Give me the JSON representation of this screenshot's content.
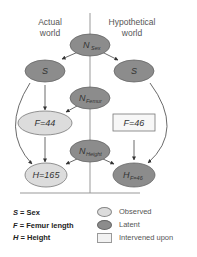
{
  "headers": {
    "actual": [
      "Actual",
      "world"
    ],
    "hypothetical": [
      "Hypothetical",
      "world"
    ]
  },
  "nodes": {
    "n_sex": {
      "main": "N",
      "sub": "Sex",
      "type": "latent"
    },
    "s_actual": {
      "main": "S",
      "type": "latent"
    },
    "s_hypo": {
      "main": "S",
      "type": "latent"
    },
    "n_femur": {
      "main": "N",
      "sub": "Femur",
      "type": "latent"
    },
    "f_actual": {
      "main": "F=44",
      "type": "observed"
    },
    "f_hypo": {
      "main": "F=46",
      "type": "intervened"
    },
    "n_height": {
      "main": "N",
      "sub": "Height",
      "type": "latent"
    },
    "h_actual": {
      "main": "H=165",
      "type": "observed"
    },
    "h_hypo": {
      "main": "H",
      "sub": "F=46",
      "type": "latent"
    }
  },
  "legend": {
    "variables": [
      {
        "symbol": "S",
        "label": "= Sex"
      },
      {
        "symbol": "F",
        "label": "= Femur length"
      },
      {
        "symbol": "H",
        "label": "= Height"
      }
    ],
    "types": [
      {
        "key": "observed",
        "label": "Observed"
      },
      {
        "key": "latent",
        "label": "Latent"
      },
      {
        "key": "intervened",
        "label": "Intervened upon"
      }
    ]
  },
  "colors": {
    "observed_fill": "#dcdcdc",
    "latent_fill": "#8c8c8c",
    "intervened_fill": "#f2f2f2",
    "stroke": "#666666",
    "divider": "#999999"
  }
}
